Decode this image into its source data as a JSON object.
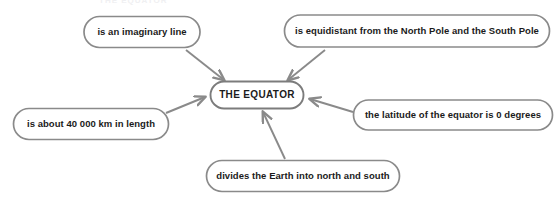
{
  "diagram": {
    "title_fragment": "THE EQUATOR",
    "center": {
      "label": "THE EQUATOR",
      "x": 257,
      "y": 95,
      "w": 93,
      "h": 27
    },
    "nodes": [
      {
        "id": "imaginary-line",
        "label": "is an imaginary line",
        "x": 142,
        "y": 32,
        "w": 116,
        "h": 31
      },
      {
        "id": "equidistant-poles",
        "label": "is equidistant from the North Pole and the South Pole",
        "x": 417,
        "y": 31,
        "w": 265,
        "h": 32
      },
      {
        "id": "length-40000km",
        "label": "is about 40 000 km in length",
        "x": 91,
        "y": 124,
        "w": 155,
        "h": 31
      },
      {
        "id": "latitude-zero",
        "label": "the latitude of the equator is 0 degrees",
        "x": 453,
        "y": 115,
        "w": 199,
        "h": 30
      },
      {
        "id": "divides-earth",
        "label": "divides the Earth into north and south",
        "x": 303,
        "y": 176,
        "w": 193,
        "h": 31
      }
    ],
    "connectors": [
      {
        "id": "arrow-imaginary-line-to-equator",
        "from": "imaginary-line",
        "to": "center"
      },
      {
        "id": "arrow-equidistant-to-equator",
        "from": "equidistant-poles",
        "to": "center"
      },
      {
        "id": "arrow-length-to-equator",
        "from": "length-40000km",
        "to": "center"
      },
      {
        "id": "arrow-latitude-to-equator",
        "from": "latitude-zero",
        "to": "center"
      },
      {
        "id": "arrow-divides-to-equator",
        "from": "divides-earth",
        "to": "center"
      }
    ],
    "colors": {
      "stroke": "#8a8a8a",
      "text": "#1b1b1b",
      "background": "#ffffff"
    }
  }
}
